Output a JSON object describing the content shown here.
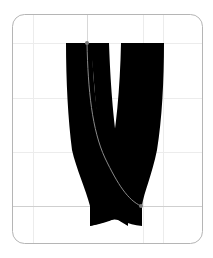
{
  "glyph_preview": {
    "glyph": "V",
    "frame": {
      "x": 12,
      "y": 14,
      "width": 191,
      "height": 230,
      "radius": 12,
      "stroke": "#b5b5b5"
    },
    "grid": {
      "color": "#e8e8e8",
      "baseline_color": "#c8c8c8",
      "vertical_x": [
        33,
        88,
        143,
        163
      ],
      "horizontal_y": [
        43,
        98,
        152
      ],
      "baseline_y": 206
    },
    "fill_color": "#000000",
    "outline_color": "#8a8a8a",
    "anchor_points": [
      {
        "x": 87,
        "y": 43
      },
      {
        "x": 141,
        "y": 206
      }
    ]
  }
}
